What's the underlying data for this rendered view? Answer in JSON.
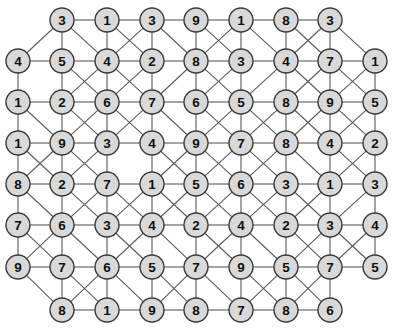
{
  "graph": {
    "title": "Undirected weighted node grid",
    "node_fill_color": "#d9d9d9",
    "node_stroke_color": "#3a3a3a",
    "edge_color": "#5a5a5a",
    "background_color": "#ffffff",
    "node_radius": 12,
    "node_count": 74,
    "row_count": 8,
    "column_count": 9,
    "rows": [
      {
        "index": 0,
        "y": 20,
        "start_column": 1,
        "labels": [
          "3",
          "1",
          "3",
          "9",
          "1",
          "8",
          "3"
        ]
      },
      {
        "index": 1,
        "y": 61,
        "start_column": 0,
        "labels": [
          "4",
          "5",
          "4",
          "2",
          "8",
          "3",
          "4",
          "7",
          "1"
        ]
      },
      {
        "index": 2,
        "y": 102,
        "start_column": 0,
        "labels": [
          "1",
          "2",
          "6",
          "7",
          "6",
          "5",
          "8",
          "9",
          "5"
        ]
      },
      {
        "index": 3,
        "y": 143,
        "start_column": 0,
        "labels": [
          "1",
          "9",
          "3",
          "4",
          "9",
          "7",
          "8",
          "4",
          "2"
        ]
      },
      {
        "index": 4,
        "y": 184,
        "start_column": 0,
        "labels": [
          "8",
          "2",
          "7",
          "1",
          "5",
          "6",
          "3",
          "1",
          "3"
        ]
      },
      {
        "index": 5,
        "y": 225,
        "start_column": 0,
        "labels": [
          "7",
          "6",
          "3",
          "4",
          "2",
          "4",
          "2",
          "3",
          "4"
        ]
      },
      {
        "index": 6,
        "y": 267,
        "start_column": 0,
        "labels": [
          "9",
          "7",
          "6",
          "5",
          "7",
          "9",
          "5",
          "7",
          "5"
        ]
      },
      {
        "index": 7,
        "y": 310,
        "start_column": 1,
        "labels": [
          "8",
          "1",
          "9",
          "8",
          "7",
          "8",
          "6"
        ]
      }
    ],
    "column_x": [
      18,
      62,
      107,
      152,
      196,
      241,
      286,
      330,
      375
    ],
    "edges_horizontal": [
      [
        0,
        1,
        0,
        2
      ],
      [
        0,
        2,
        0,
        3
      ],
      [
        0,
        3,
        0,
        4
      ],
      [
        0,
        4,
        0,
        5
      ],
      [
        0,
        5,
        0,
        6
      ],
      [
        0,
        6,
        0,
        7
      ],
      [
        1,
        0,
        1,
        1
      ],
      [
        1,
        1,
        1,
        2
      ],
      [
        1,
        2,
        1,
        3
      ],
      [
        1,
        3,
        1,
        4
      ],
      [
        1,
        4,
        1,
        5
      ],
      [
        1,
        5,
        1,
        6
      ],
      [
        1,
        6,
        1,
        7
      ],
      [
        1,
        7,
        1,
        8
      ],
      [
        2,
        0,
        2,
        1
      ],
      [
        2,
        1,
        2,
        2
      ],
      [
        2,
        2,
        2,
        3
      ],
      [
        2,
        3,
        2,
        4
      ],
      [
        2,
        4,
        2,
        5
      ],
      [
        2,
        5,
        2,
        6
      ],
      [
        2,
        6,
        2,
        7
      ],
      [
        2,
        7,
        2,
        8
      ],
      [
        3,
        0,
        3,
        1
      ],
      [
        3,
        1,
        3,
        2
      ],
      [
        3,
        2,
        3,
        3
      ],
      [
        3,
        3,
        3,
        4
      ],
      [
        3,
        4,
        3,
        5
      ],
      [
        3,
        5,
        3,
        6
      ],
      [
        3,
        6,
        3,
        7
      ],
      [
        3,
        7,
        3,
        8
      ],
      [
        4,
        0,
        4,
        1
      ],
      [
        4,
        1,
        4,
        2
      ],
      [
        4,
        2,
        4,
        3
      ],
      [
        4,
        3,
        4,
        4
      ],
      [
        4,
        4,
        4,
        5
      ],
      [
        4,
        5,
        4,
        6
      ],
      [
        4,
        6,
        4,
        7
      ],
      [
        4,
        7,
        4,
        8
      ],
      [
        5,
        0,
        5,
        1
      ],
      [
        5,
        1,
        5,
        2
      ],
      [
        5,
        2,
        5,
        3
      ],
      [
        5,
        3,
        5,
        4
      ],
      [
        5,
        4,
        5,
        5
      ],
      [
        5,
        5,
        5,
        6
      ],
      [
        5,
        6,
        5,
        7
      ],
      [
        5,
        7,
        5,
        8
      ],
      [
        6,
        0,
        6,
        1
      ],
      [
        6,
        1,
        6,
        2
      ],
      [
        6,
        2,
        6,
        3
      ],
      [
        6,
        3,
        6,
        4
      ],
      [
        6,
        4,
        6,
        5
      ],
      [
        6,
        5,
        6,
        6
      ],
      [
        6,
        6,
        6,
        7
      ],
      [
        6,
        7,
        6,
        8
      ],
      [
        7,
        1,
        7,
        2
      ],
      [
        7,
        2,
        7,
        3
      ],
      [
        7,
        3,
        7,
        4
      ],
      [
        7,
        4,
        7,
        5
      ],
      [
        7,
        5,
        7,
        6
      ],
      [
        7,
        6,
        7,
        7
      ]
    ],
    "edges_vertical": [
      [
        0,
        1,
        1,
        1
      ],
      [
        0,
        2,
        1,
        2
      ],
      [
        0,
        3,
        1,
        3
      ],
      [
        0,
        4,
        1,
        4
      ],
      [
        0,
        5,
        1,
        5
      ],
      [
        0,
        6,
        1,
        6
      ],
      [
        0,
        7,
        1,
        7
      ],
      [
        1,
        0,
        2,
        0
      ],
      [
        1,
        1,
        2,
        1
      ],
      [
        1,
        2,
        2,
        2
      ],
      [
        1,
        3,
        2,
        3
      ],
      [
        1,
        4,
        2,
        4
      ],
      [
        1,
        5,
        2,
        5
      ],
      [
        1,
        6,
        2,
        6
      ],
      [
        1,
        7,
        2,
        7
      ],
      [
        1,
        8,
        2,
        8
      ],
      [
        2,
        0,
        3,
        0
      ],
      [
        2,
        1,
        3,
        1
      ],
      [
        2,
        2,
        3,
        2
      ],
      [
        2,
        3,
        3,
        3
      ],
      [
        2,
        4,
        3,
        4
      ],
      [
        2,
        5,
        3,
        5
      ],
      [
        2,
        6,
        3,
        6
      ],
      [
        2,
        7,
        3,
        7
      ],
      [
        2,
        8,
        3,
        8
      ],
      [
        3,
        0,
        4,
        0
      ],
      [
        3,
        1,
        4,
        1
      ],
      [
        3,
        2,
        4,
        2
      ],
      [
        3,
        3,
        4,
        3
      ],
      [
        3,
        4,
        4,
        4
      ],
      [
        3,
        5,
        4,
        5
      ],
      [
        3,
        6,
        4,
        6
      ],
      [
        3,
        7,
        4,
        7
      ],
      [
        3,
        8,
        4,
        8
      ],
      [
        4,
        0,
        5,
        0
      ],
      [
        4,
        1,
        5,
        1
      ],
      [
        4,
        2,
        5,
        2
      ],
      [
        4,
        3,
        5,
        3
      ],
      [
        4,
        4,
        5,
        4
      ],
      [
        4,
        5,
        5,
        5
      ],
      [
        4,
        6,
        5,
        6
      ],
      [
        4,
        7,
        5,
        7
      ],
      [
        4,
        8,
        5,
        8
      ],
      [
        5,
        0,
        6,
        0
      ],
      [
        5,
        1,
        6,
        1
      ],
      [
        5,
        2,
        6,
        2
      ],
      [
        5,
        3,
        6,
        3
      ],
      [
        5,
        4,
        6,
        4
      ],
      [
        5,
        5,
        6,
        5
      ],
      [
        5,
        6,
        6,
        6
      ],
      [
        5,
        7,
        6,
        7
      ],
      [
        5,
        8,
        6,
        8
      ],
      [
        6,
        1,
        7,
        1
      ],
      [
        6,
        2,
        7,
        2
      ],
      [
        6,
        3,
        7,
        3
      ],
      [
        6,
        4,
        7,
        4
      ],
      [
        6,
        5,
        7,
        5
      ],
      [
        6,
        6,
        7,
        6
      ],
      [
        6,
        7,
        7,
        7
      ]
    ],
    "edges_diagonal": [
      [
        0,
        1,
        1,
        0
      ],
      [
        0,
        1,
        1,
        2
      ],
      [
        0,
        2,
        1,
        3
      ],
      [
        0,
        3,
        1,
        2
      ],
      [
        0,
        3,
        1,
        4
      ],
      [
        0,
        4,
        1,
        5
      ],
      [
        0,
        5,
        1,
        4
      ],
      [
        0,
        5,
        1,
        6
      ],
      [
        0,
        6,
        1,
        7
      ],
      [
        0,
        7,
        1,
        6
      ],
      [
        0,
        7,
        1,
        8
      ],
      [
        1,
        1,
        2,
        2
      ],
      [
        1,
        2,
        2,
        1
      ],
      [
        1,
        2,
        2,
        3
      ],
      [
        1,
        3,
        2,
        2
      ],
      [
        1,
        4,
        2,
        3
      ],
      [
        1,
        4,
        2,
        5
      ],
      [
        1,
        5,
        2,
        4
      ],
      [
        1,
        6,
        2,
        5
      ],
      [
        1,
        6,
        2,
        7
      ],
      [
        1,
        7,
        2,
        6
      ],
      [
        1,
        7,
        2,
        8
      ],
      [
        1,
        8,
        2,
        7
      ],
      [
        2,
        0,
        3,
        1
      ],
      [
        2,
        1,
        3,
        2
      ],
      [
        2,
        2,
        3,
        1
      ],
      [
        2,
        2,
        3,
        3
      ],
      [
        2,
        3,
        3,
        2
      ],
      [
        2,
        3,
        3,
        4
      ],
      [
        2,
        4,
        3,
        5
      ],
      [
        2,
        5,
        3,
        4
      ],
      [
        2,
        5,
        3,
        6
      ],
      [
        2,
        6,
        3,
        5
      ],
      [
        2,
        6,
        3,
        7
      ],
      [
        2,
        7,
        3,
        6
      ],
      [
        2,
        7,
        3,
        8
      ],
      [
        2,
        8,
        3,
        7
      ],
      [
        3,
        0,
        4,
        1
      ],
      [
        3,
        1,
        4,
        0
      ],
      [
        3,
        1,
        4,
        2
      ],
      [
        3,
        2,
        4,
        1
      ],
      [
        3,
        3,
        4,
        4
      ],
      [
        3,
        4,
        4,
        3
      ],
      [
        3,
        4,
        4,
        5
      ],
      [
        3,
        5,
        4,
        4
      ],
      [
        3,
        5,
        4,
        6
      ],
      [
        3,
        6,
        4,
        5
      ],
      [
        3,
        6,
        4,
        7
      ],
      [
        3,
        7,
        4,
        8
      ],
      [
        3,
        8,
        4,
        7
      ],
      [
        4,
        0,
        5,
        1
      ],
      [
        4,
        1,
        5,
        2
      ],
      [
        4,
        2,
        5,
        1
      ],
      [
        4,
        2,
        5,
        3
      ],
      [
        4,
        3,
        5,
        2
      ],
      [
        4,
        3,
        5,
        4
      ],
      [
        4,
        4,
        5,
        3
      ],
      [
        4,
        4,
        5,
        5
      ],
      [
        4,
        5,
        5,
        4
      ],
      [
        4,
        5,
        5,
        6
      ],
      [
        4,
        6,
        5,
        5
      ],
      [
        4,
        6,
        5,
        7
      ],
      [
        4,
        7,
        5,
        6
      ],
      [
        4,
        8,
        5,
        7
      ],
      [
        5,
        0,
        6,
        1
      ],
      [
        5,
        1,
        6,
        0
      ],
      [
        5,
        1,
        6,
        2
      ],
      [
        5,
        2,
        6,
        3
      ],
      [
        5,
        3,
        6,
        2
      ],
      [
        5,
        3,
        6,
        4
      ],
      [
        5,
        4,
        6,
        5
      ],
      [
        5,
        5,
        6,
        4
      ],
      [
        5,
        5,
        6,
        6
      ],
      [
        5,
        6,
        6,
        7
      ],
      [
        5,
        7,
        6,
        6
      ],
      [
        5,
        7,
        6,
        8
      ],
      [
        5,
        8,
        6,
        7
      ],
      [
        6,
        0,
        7,
        1
      ],
      [
        6,
        1,
        7,
        2
      ],
      [
        6,
        2,
        7,
        1
      ],
      [
        6,
        2,
        7,
        3
      ],
      [
        6,
        3,
        7,
        4
      ],
      [
        6,
        4,
        7,
        3
      ],
      [
        6,
        4,
        7,
        5
      ],
      [
        6,
        5,
        7,
        6
      ],
      [
        6,
        6,
        7,
        5
      ],
      [
        6,
        6,
        7,
        7
      ],
      [
        6,
        7,
        7,
        6
      ]
    ]
  }
}
